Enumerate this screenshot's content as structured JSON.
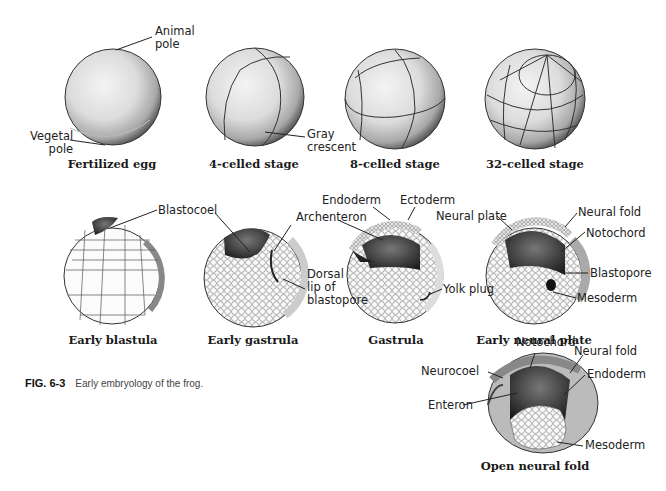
{
  "figure": {
    "number": "FIG. 6-3",
    "caption": "Early embryology of the frog."
  },
  "stages": [
    {
      "name": "Fertilized egg",
      "labels": [
        "Animal pole",
        "Vegetal pole"
      ]
    },
    {
      "name": "4-celled stage",
      "labels": [
        "Gray crescent"
      ]
    },
    {
      "name": "8-celled stage",
      "labels": []
    },
    {
      "name": "32-celled stage",
      "labels": []
    },
    {
      "name": "Early blastula",
      "labels": [
        "Blastocoel"
      ]
    },
    {
      "name": "Early gastrula",
      "labels": [
        "Archenteron",
        "Dorsal lip of blastopore"
      ]
    },
    {
      "name": "Gastrula",
      "labels": [
        "Endoderm",
        "Ectoderm",
        "Yolk plug"
      ]
    },
    {
      "name": "Early neural plate",
      "labels": [
        "Neural plate",
        "Neural fold",
        "Notochord",
        "Blastopore",
        "Mesoderm"
      ]
    },
    {
      "name": "Open neural fold",
      "labels": [
        "Notochord",
        "Neural fold",
        "Neurocoel",
        "Endoderm",
        "Enteron",
        "Mesoderm"
      ]
    }
  ],
  "labels": {
    "animal_pole_1": "Animal",
    "animal_pole_2": "pole",
    "vegetal_pole_1": "Vegetal",
    "vegetal_pole_2": "pole",
    "gray_crescent_1": "Gray",
    "gray_crescent_2": "crescent",
    "blastocoel": "Blastocoel",
    "archenteron": "Archenteron",
    "dorsal_lip_1": "Dorsal",
    "dorsal_lip_2": "lip of",
    "dorsal_lip_3": "blastopore",
    "endoderm_g": "Endoderm",
    "ectoderm_g": "Ectoderm",
    "yolk_plug": "Yolk plug",
    "neural_plate": "Neural plate",
    "neural_fold_enp": "Neural fold",
    "notochord_enp": "Notochord",
    "blastopore_enp": "Blastopore",
    "mesoderm_enp": "Mesoderm",
    "notochord_onf": "Notochord",
    "neural_fold_onf": "Neural fold",
    "neurocoel": "Neurocoel",
    "endoderm_onf": "Endoderm",
    "enteron": "Enteron",
    "mesoderm_onf": "Mesoderm"
  },
  "captions": {
    "fertilized_egg": "Fertilized egg",
    "four_cell": "4-celled stage",
    "eight_cell": "8-celled stage",
    "thirtytwo_cell": "32-celled stage",
    "early_blastula": "Early blastula",
    "early_gastrula": "Early gastrula",
    "gastrula": "Gastrula",
    "early_neural_plate": "Early neural plate",
    "open_neural_fold": "Open neural fold"
  }
}
